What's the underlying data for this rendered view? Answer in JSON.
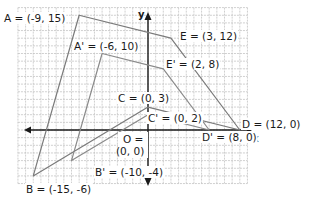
{
  "diagram": {
    "type": "coordinate-plane-dilation",
    "axes": {
      "x_label": "x",
      "y_label": "y"
    },
    "grid": {
      "x_min": -17,
      "x_max": 13,
      "y_min": -7,
      "y_max": 16
    },
    "colors": {
      "grid": "#c4c4c4",
      "axis": "#1a1a1a",
      "figure": "#7a7a7a",
      "image": "#8a8a8a"
    },
    "original_figure": {
      "name": "ABCDE",
      "points": [
        {
          "name": "A",
          "x": -9,
          "y": 15,
          "label": "A = (-9, 15)"
        },
        {
          "name": "B",
          "x": -15,
          "y": -6,
          "label": "B = (-15, -6)"
        },
        {
          "name": "C",
          "x": 0,
          "y": 3,
          "label": "C = (0, 3)"
        },
        {
          "name": "D",
          "x": 12,
          "y": 0,
          "label": "D = (12, 0)"
        },
        {
          "name": "E",
          "x": 3,
          "y": 12,
          "label": "E = (3, 12)"
        }
      ]
    },
    "image_figure": {
      "name": "A'B'C'D'E'",
      "points": [
        {
          "name": "A'",
          "x": -6,
          "y": 10,
          "label": "A' = (-6, 10)"
        },
        {
          "name": "B'",
          "x": -10,
          "y": -4,
          "label": "B' = (-10, -4)"
        },
        {
          "name": "C'",
          "x": 0,
          "y": 2,
          "label": "C' = (0, 2)"
        },
        {
          "name": "D'",
          "x": 8,
          "y": 0,
          "label": "D' = (8, 0)"
        },
        {
          "name": "E'",
          "x": 2,
          "y": 8,
          "label": "E' = (2, 8)"
        }
      ]
    },
    "origin": {
      "label_line1": "O =",
      "label_line2": "(0, 0)"
    }
  }
}
